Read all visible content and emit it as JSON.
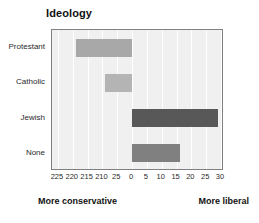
{
  "chart_data": {
    "type": "bar",
    "orientation": "horizontal",
    "title": "Ideology",
    "xlabel": "",
    "ylabel": "",
    "categories": [
      "Protestant",
      "Catholic",
      "Jewish",
      "None"
    ],
    "values": [
      -19,
      -9,
      29,
      16
    ],
    "bar_colors": [
      "#a8a8a8",
      "#b4b4b4",
      "#585858",
      "#808080"
    ],
    "xlim": [
      -27,
      31
    ],
    "xticks": [
      -25,
      -20,
      -15,
      -10,
      -5,
      0,
      5,
      10,
      15,
      20,
      25,
      30
    ],
    "xtick_labels": [
      "225",
      "220",
      "215",
      "210",
      "25",
      "0",
      "5",
      "10",
      "15",
      "20",
      "25",
      "30"
    ],
    "grid": "vertical",
    "legend": "none",
    "zero_reference": 0,
    "annotations": {
      "left": "More conservative",
      "right": "More liberal"
    }
  },
  "style": {
    "plot_background": "#f0f0f0",
    "plot_border": "#808080",
    "gridline_color": "#ffffff",
    "text_color": "#1a1a1a",
    "page_background": "#ffffff"
  }
}
